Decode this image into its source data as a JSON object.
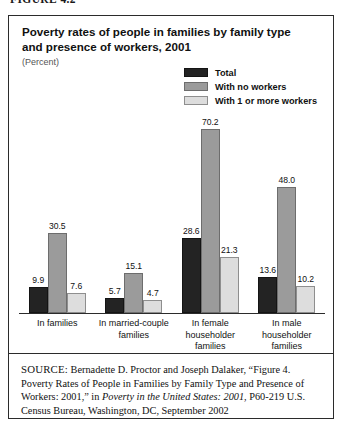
{
  "figure_caption": "FIGURE 4.2",
  "chart_data": {
    "type": "bar",
    "title": "Poverty rates of people in families by family type and presence of workers, 2001",
    "subtitle": "(Percent)",
    "xlabel": "",
    "ylabel": "Percent",
    "ylim": [
      0,
      75
    ],
    "grid": false,
    "legend_position": "top-right",
    "categories": [
      "In families",
      "In married-couple families",
      "In female householder families",
      "In male householder families"
    ],
    "category_lines": [
      [
        "In families"
      ],
      [
        "In married-couple",
        "families"
      ],
      [
        "In female",
        "householder",
        "families"
      ],
      [
        "In male",
        "householder",
        "families"
      ]
    ],
    "series": [
      {
        "name": "Total",
        "color": "#232323",
        "values": [
          9.9,
          5.7,
          28.6,
          13.6
        ]
      },
      {
        "name": "With no workers",
        "color": "#9b9b9b",
        "values": [
          30.5,
          15.1,
          70.2,
          48.0
        ]
      },
      {
        "name": "With 1 or more workers",
        "color": "#dddddd",
        "values": [
          7.6,
          4.7,
          21.3,
          10.2
        ]
      }
    ]
  },
  "source": {
    "label": "SOURCE:",
    "text_part1": " Bernadette D. Proctor and Joseph Dalaker, “Figure 4. Poverty Rates of People in Families by Family Type and Presence of Workers: 2001,” in ",
    "italic_title": "Poverty in the United States: 2001",
    "text_part2": ", P60-219 U.S. Census Bureau, Washington, DC, September 2002"
  }
}
